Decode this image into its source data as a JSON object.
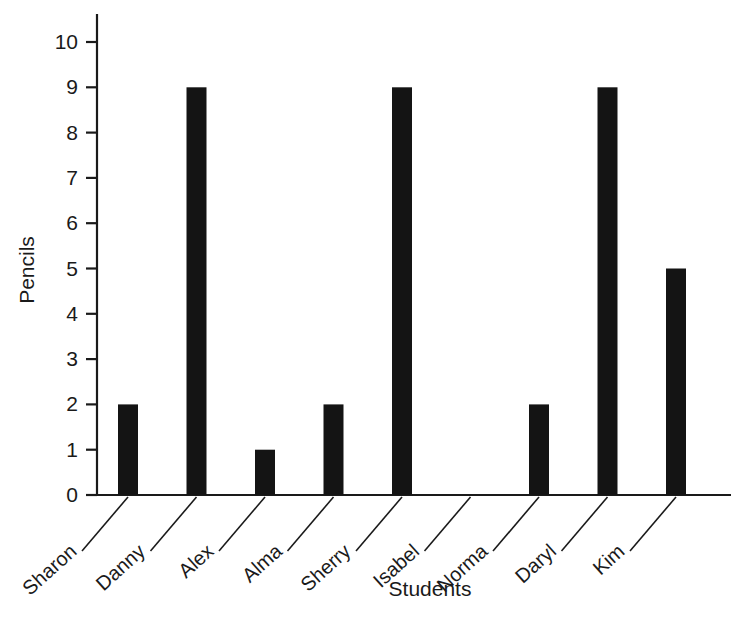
{
  "chart_data": {
    "type": "bar",
    "title": "",
    "xlabel": "Students",
    "ylabel": "Pencils",
    "categories": [
      "Sharon",
      "Danny",
      "Alex",
      "Alma",
      "Sherry",
      "Isabel",
      "Norma",
      "Daryl",
      "Kim"
    ],
    "values": [
      2,
      9,
      1,
      2,
      9,
      0,
      2,
      9,
      5
    ],
    "ylim": [
      0,
      10
    ],
    "ytick_labels": [
      "0",
      "1",
      "2",
      "3",
      "4",
      "5",
      "6",
      "7",
      "8",
      "9",
      "10"
    ],
    "ytick_values": [
      0,
      1,
      2,
      3,
      4,
      5,
      6,
      7,
      8,
      9,
      10
    ],
    "grid": false,
    "legend": null,
    "bar_color": "#141414",
    "axis_color": "#1a1a1a",
    "background_color": "#ffffff",
    "annotations": []
  },
  "axes": {
    "y_title": "Pencils",
    "x_title": "Students"
  }
}
